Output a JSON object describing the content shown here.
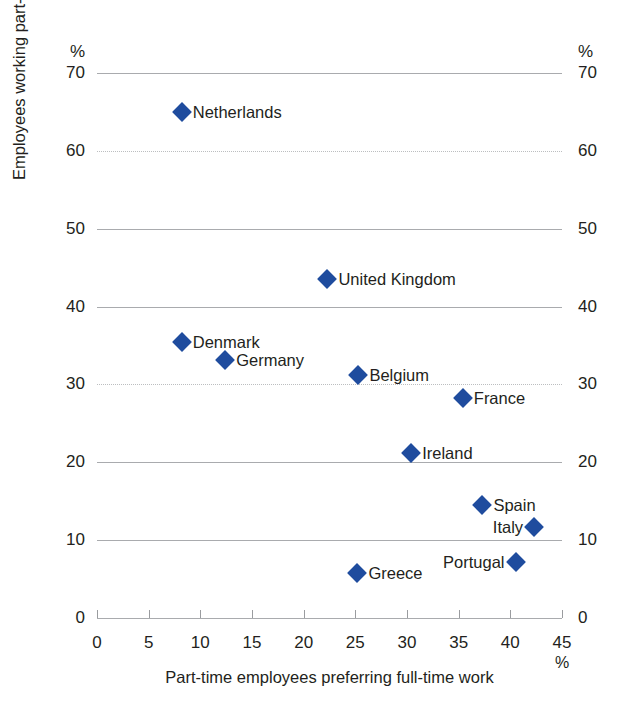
{
  "chart_data": {
    "type": "scatter",
    "title": "",
    "xlabel": "Part-time employees preferring full-time work",
    "ylabel": "Employees working part-time",
    "x_unit": "%",
    "y_unit": "%",
    "xlim": [
      0,
      45
    ],
    "ylim": [
      0,
      70
    ],
    "xticks": [
      "0",
      "5",
      "10",
      "15",
      "20",
      "25",
      "30",
      "35",
      "40",
      "45"
    ],
    "xtick_values": [
      0,
      5,
      10,
      15,
      20,
      25,
      30,
      35,
      40,
      45
    ],
    "yticks": [
      "0",
      "10",
      "20",
      "30",
      "40",
      "50",
      "60",
      "70"
    ],
    "ytick_values": [
      0,
      10,
      20,
      30,
      40,
      50,
      60,
      70
    ],
    "grid": "horizontal",
    "gridlines_solid": [
      0,
      10,
      20,
      40,
      50,
      70
    ],
    "gridlines_dotted": [
      30,
      60
    ],
    "legend": "none",
    "marker_shape": "diamond",
    "marker_color": "#1f4c9e",
    "grid_color": "#a9abae",
    "text_color": "#231f20",
    "background": "#ffffff",
    "points": [
      {
        "label": "Netherlands",
        "x": 8.2,
        "y": 65.0,
        "label_side": "right"
      },
      {
        "label": "United Kingdom",
        "x": 22.3,
        "y": 43.6,
        "label_side": "right"
      },
      {
        "label": "Denmark",
        "x": 8.2,
        "y": 35.4,
        "label_side": "right"
      },
      {
        "label": "Germany",
        "x": 12.4,
        "y": 33.1,
        "label_side": "right"
      },
      {
        "label": "Belgium",
        "x": 25.3,
        "y": 31.2,
        "label_side": "right"
      },
      {
        "label": "France",
        "x": 35.4,
        "y": 28.2,
        "label_side": "right"
      },
      {
        "label": "Ireland",
        "x": 30.4,
        "y": 21.2,
        "label_side": "right"
      },
      {
        "label": "Spain",
        "x": 37.3,
        "y": 14.5,
        "label_side": "right"
      },
      {
        "label": "Italy",
        "x": 42.3,
        "y": 11.7,
        "label_side": "left"
      },
      {
        "label": "Portugal",
        "x": 40.5,
        "y": 7.2,
        "label_side": "left"
      },
      {
        "label": "Greece",
        "x": 25.2,
        "y": 5.8,
        "label_side": "right"
      }
    ]
  }
}
